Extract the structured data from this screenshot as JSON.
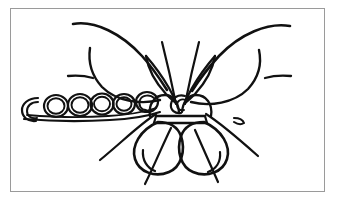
{
  "artwork": {
    "title": "Butterfly on branch line drawing",
    "medium": "black ink line drawing",
    "background_color": "#ffffff",
    "ink_color": "#111111",
    "frame_color": "#9a9a9a",
    "canvas": {
      "width": 337,
      "height": 208
    },
    "frame": {
      "x": 10,
      "y": 8,
      "width": 315,
      "height": 184,
      "border_width": 1
    },
    "subject": "butterfly",
    "parts": [
      {
        "name": "left-upper-wing",
        "description": "large curved upper wing sweeping to the upper left"
      },
      {
        "name": "right-upper-wing",
        "description": "large curved upper wing sweeping to the upper right"
      },
      {
        "name": "left-inner-wing",
        "description": "narrow pointed inner wing beside the body"
      },
      {
        "name": "right-inner-wing",
        "description": "narrow pointed inner wing beside the body"
      },
      {
        "name": "left-lower-wing",
        "description": "large oval lower wing"
      },
      {
        "name": "right-lower-wing",
        "description": "large oval lower wing"
      },
      {
        "name": "thorax",
        "description": "small banded body segment at center"
      },
      {
        "name": "left-antenna",
        "description": "thin line curving up and left"
      },
      {
        "name": "right-antenna",
        "description": "thin line curving up and right"
      },
      {
        "name": "left-leg",
        "description": "thin line angling down-left"
      },
      {
        "name": "center-leg",
        "description": "thin line angling down"
      },
      {
        "name": "right-leg",
        "description": "thin line angling down-right with small hook"
      },
      {
        "name": "branch",
        "description": "horizontal stem running left from the body"
      },
      {
        "name": "coil-chain",
        "description": "row of circular coil loops along the branch"
      }
    ],
    "coil_count": 6
  }
}
